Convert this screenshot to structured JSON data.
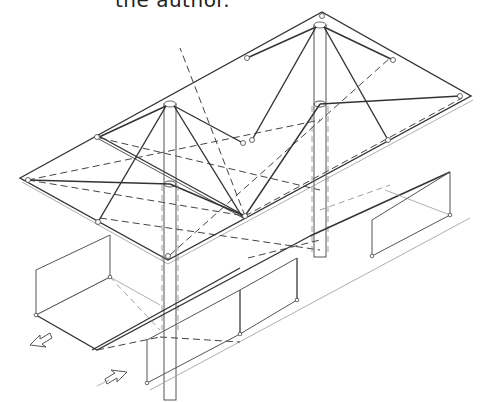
{
  "caption": {
    "text": "the author."
  },
  "figure": {
    "type": "isometric-axonometric-drawing",
    "components": [
      {
        "name": "roof-plane",
        "description": "rectangular flat roof plate"
      },
      {
        "name": "column-left",
        "description": "central mast with cable stays"
      },
      {
        "name": "column-right",
        "description": "central mast with cable stays"
      },
      {
        "name": "floor-base",
        "description": "rectangular ground platform"
      },
      {
        "name": "wall-panels",
        "description": "transparent perimeter wall panels"
      },
      {
        "name": "entry-arrows",
        "description": "two hollow arrows indicating circulation"
      }
    ],
    "colors": {
      "line": "#555555",
      "background": "#ffffff"
    }
  }
}
